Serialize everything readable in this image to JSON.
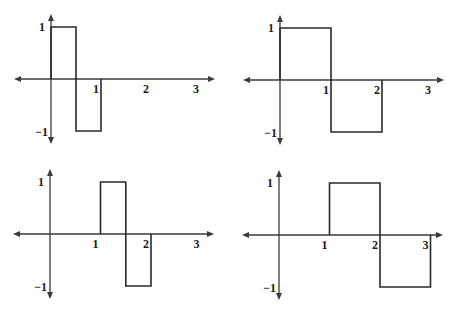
{
  "chart_data": [
    {
      "type": "line",
      "title": "",
      "xlabel": "",
      "ylabel": "",
      "xlim": [
        -0.75,
        3.25
      ],
      "ylim": [
        -1.2,
        1.2
      ],
      "grid": false,
      "xticks": [
        "1",
        "2",
        "3"
      ],
      "yticks": [
        "1",
        "-1"
      ],
      "series": [
        {
          "name": "psi_0,0",
          "x": [
            0,
            0,
            0.5,
            0.5,
            1,
            1
          ],
          "y": [
            0,
            1,
            1,
            -1,
            -1,
            0
          ]
        }
      ]
    },
    {
      "type": "line",
      "title": "",
      "xlabel": "",
      "ylabel": "",
      "xlim": [
        -0.75,
        3.25
      ],
      "ylim": [
        -1.2,
        1.2
      ],
      "grid": false,
      "xticks": [
        "1",
        "2",
        "3"
      ],
      "yticks": [
        "1",
        "-1"
      ],
      "series": [
        {
          "name": "psi_-1,0",
          "x": [
            0,
            0,
            1,
            1,
            2,
            2
          ],
          "y": [
            0,
            1,
            1,
            -1,
            -1,
            0
          ]
        }
      ]
    },
    {
      "type": "line",
      "title": "",
      "xlabel": "",
      "ylabel": "",
      "xlim": [
        -0.75,
        3.25
      ],
      "ylim": [
        -1.2,
        1.2
      ],
      "grid": false,
      "xticks": [
        "1",
        "2",
        "3"
      ],
      "yticks": [
        "1",
        "-1"
      ],
      "series": [
        {
          "name": "psi_0,1",
          "x": [
            1,
            1,
            1.5,
            1.5,
            2,
            2
          ],
          "y": [
            0,
            1,
            1,
            -1,
            -1,
            0
          ]
        }
      ]
    },
    {
      "type": "line",
      "title": "",
      "xlabel": "",
      "ylabel": "",
      "xlim": [
        -0.75,
        3.25
      ],
      "ylim": [
        -1.2,
        1.2
      ],
      "grid": false,
      "xticks": [
        "1",
        "2",
        "3"
      ],
      "yticks": [
        "1",
        "-1"
      ],
      "series": [
        {
          "name": "psi_-1,1/2",
          "x": [
            1,
            1,
            2,
            2,
            3,
            3
          ],
          "y": [
            0,
            1,
            1,
            -1,
            -1,
            0
          ]
        }
      ]
    }
  ],
  "labels": {
    "tick_1": "1",
    "tick_2": "2",
    "tick_3": "3",
    "ytick_pos": "1",
    "ytick_neg": "−1"
  }
}
